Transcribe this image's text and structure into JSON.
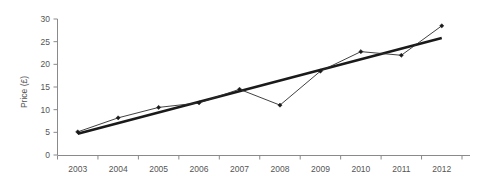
{
  "chart_data": {
    "type": "line",
    "title": "",
    "xlabel": "",
    "ylabel": "Price (£)",
    "categories": [
      "2003",
      "2004",
      "2005",
      "2006",
      "2007",
      "2008",
      "2009",
      "2010",
      "2011",
      "2012"
    ],
    "x": [
      2003,
      2004,
      2005,
      2006,
      2007,
      2008,
      2009,
      2010,
      2011,
      2012
    ],
    "series": [
      {
        "name": "Price",
        "values": [
          5.1,
          8.2,
          10.5,
          11.5,
          14.5,
          11.0,
          18.5,
          22.8,
          22.0,
          28.5
        ],
        "marker": "diamond",
        "color": "#1a1a1a"
      },
      {
        "name": "Linear trendline",
        "values": [
          4.7,
          7.05,
          9.4,
          11.75,
          14.1,
          16.45,
          18.8,
          21.15,
          23.5,
          25.8
        ],
        "marker": "none",
        "color": "#1a1a1a",
        "style": "thick-straight"
      }
    ],
    "ylim": [
      0,
      30
    ],
    "yticks": [
      0,
      5,
      10,
      15,
      20,
      25,
      30
    ],
    "ytick_labels": [
      "0",
      "5",
      "10",
      "15",
      "20",
      "25",
      "30"
    ],
    "xtick_labels": [
      "2003",
      "2004",
      "2005",
      "2006",
      "2007",
      "2008",
      "2009",
      "2010",
      "2011",
      "2012"
    ],
    "grid": false,
    "legend": "none",
    "axis_color": "#8a8a8a",
    "text_color": "#555555"
  }
}
